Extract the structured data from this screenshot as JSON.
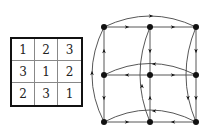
{
  "latin_square": {
    "rows": [
      [
        "1",
        "2",
        "3"
      ],
      [
        "3",
        "1",
        "2"
      ],
      [
        "2",
        "3",
        "1"
      ]
    ]
  },
  "graph": {
    "nodes": [
      {
        "id": "n00",
        "x": 104,
        "y": 27
      },
      {
        "id": "n01",
        "x": 150,
        "y": 27
      },
      {
        "id": "n02",
        "x": 196,
        "y": 27
      },
      {
        "id": "n10",
        "x": 104,
        "y": 75
      },
      {
        "id": "n11",
        "x": 150,
        "y": 75
      },
      {
        "id": "n12",
        "x": 196,
        "y": 75
      },
      {
        "id": "n20",
        "x": 104,
        "y": 122
      },
      {
        "id": "n21",
        "x": 150,
        "y": 122
      },
      {
        "id": "n22",
        "x": 196,
        "y": 122
      }
    ],
    "colors": {
      "edge": "#444444",
      "node": "#111111"
    }
  }
}
